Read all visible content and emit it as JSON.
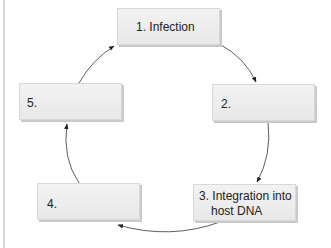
{
  "diagram": {
    "type": "cycle",
    "steps": [
      {
        "id": 1,
        "label": "1. Infection"
      },
      {
        "id": 2,
        "label": "2."
      },
      {
        "id": 3,
        "label": "3. Integration into",
        "label_line2": "host DNA"
      },
      {
        "id": 4,
        "label": "4."
      },
      {
        "id": 5,
        "label": "5."
      }
    ],
    "edges": [
      [
        1,
        2
      ],
      [
        2,
        3
      ],
      [
        3,
        4
      ],
      [
        4,
        5
      ],
      [
        5,
        1
      ]
    ],
    "colors": {
      "box": "#ececec",
      "arrow": "#222222",
      "border_line": "#d6d6d6"
    }
  }
}
